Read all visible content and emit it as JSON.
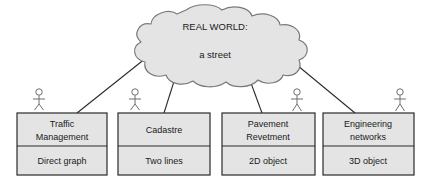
{
  "diagram": {
    "title_node": {
      "name": "real-world-cloud",
      "line1": "REAL WORLD:",
      "line2": "a street",
      "shape": "cloud",
      "fill": "#e4e4e4",
      "stroke": "#7a7a7a"
    },
    "actor_icon_name": "actor-stick-figure-icon",
    "box_fill": "#e4e4e4",
    "box_stroke": "#2b2b2b",
    "connector_color": "#2b2b2b",
    "boxes": [
      {
        "id": "traffic-management",
        "header_line1": "Traffic",
        "header_line2": "Management",
        "body": "Direct graph"
      },
      {
        "id": "cadastre",
        "header_line1": "Cadastre",
        "header_line2": "",
        "body": "Two lines"
      },
      {
        "id": "pavement-revetment",
        "header_line1": "Pavement",
        "header_line2": "Revetment",
        "body": "2D object"
      },
      {
        "id": "engineering-networks",
        "header_line1": "Engineering",
        "header_line2": "networks",
        "body": "3D object"
      }
    ]
  }
}
